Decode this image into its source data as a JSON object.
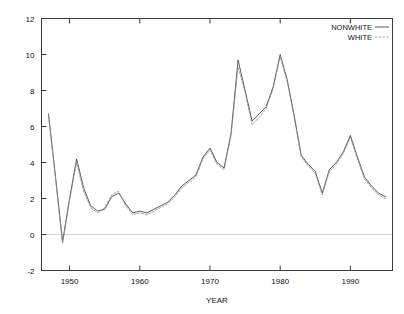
{
  "chart_data": {
    "type": "line",
    "title": "",
    "xlabel": "YEAR",
    "ylabel": "",
    "xlim": [
      1946,
      1996
    ],
    "ylim": [
      -2,
      12
    ],
    "xticks": [
      1950,
      1960,
      1970,
      1980,
      1990
    ],
    "xtick_labels": [
      "1950",
      "1960",
      "1970",
      "1980",
      "1990"
    ],
    "yticks": [
      -2,
      0,
      2,
      4,
      6,
      8,
      10,
      12
    ],
    "ytick_labels": [
      "-2",
      "0",
      "2",
      "4",
      "6",
      "8",
      "10",
      "12"
    ],
    "grid": false,
    "zero_line": true,
    "legend_position": "top-right",
    "x": [
      1947,
      1948,
      1949,
      1950,
      1951,
      1952,
      1953,
      1954,
      1955,
      1956,
      1957,
      1958,
      1959,
      1960,
      1961,
      1962,
      1963,
      1964,
      1965,
      1966,
      1967,
      1968,
      1969,
      1970,
      1971,
      1972,
      1973,
      1974,
      1975,
      1976,
      1977,
      1978,
      1979,
      1980,
      1981,
      1982,
      1983,
      1984,
      1985,
      1986,
      1987,
      1988,
      1989,
      1990,
      1991,
      1992,
      1993,
      1994,
      1995
    ],
    "series": [
      {
        "name": "NONWHITE",
        "style": "solid",
        "color": "#4a4a4a",
        "values": [
          6.7,
          3.2,
          -0.4,
          2.0,
          4.2,
          2.6,
          1.6,
          1.3,
          1.4,
          2.1,
          2.3,
          1.7,
          1.2,
          1.3,
          1.2,
          1.4,
          1.6,
          1.8,
          2.2,
          2.7,
          3.0,
          3.3,
          4.3,
          4.8,
          4.0,
          3.7,
          5.6,
          9.7,
          8.0,
          6.3,
          6.7,
          7.1,
          8.2,
          10.0,
          8.6,
          6.6,
          4.4,
          3.9,
          3.5,
          2.3,
          3.6,
          4.0,
          4.6,
          5.5,
          4.3,
          3.2,
          2.7,
          2.3,
          2.1
        ]
      },
      {
        "name": "WHITE",
        "style": "dashed",
        "color": "#8d8d8d",
        "values": [
          6.6,
          3.1,
          -0.5,
          1.9,
          4.0,
          2.4,
          1.5,
          1.2,
          1.5,
          2.2,
          2.4,
          1.6,
          1.1,
          1.2,
          1.1,
          1.3,
          1.5,
          1.7,
          2.1,
          2.6,
          2.9,
          3.2,
          4.2,
          4.7,
          3.9,
          3.6,
          5.5,
          9.3,
          7.9,
          6.1,
          6.5,
          7.0,
          8.1,
          9.9,
          8.5,
          6.5,
          4.3,
          3.8,
          3.4,
          2.2,
          3.5,
          3.9,
          4.5,
          5.4,
          4.2,
          3.1,
          2.6,
          2.2,
          2.0
        ]
      }
    ]
  },
  "legend": {
    "entries": [
      {
        "label": "NONWHITE"
      },
      {
        "label": "WHITE"
      }
    ]
  }
}
